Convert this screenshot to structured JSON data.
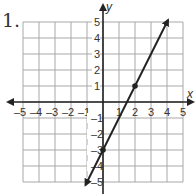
{
  "problem": {
    "number_label": "1."
  },
  "chart_data": {
    "type": "line",
    "title": "",
    "xlabel": "x",
    "ylabel": "y",
    "xlim": [
      -5,
      5
    ],
    "ylim": [
      -5,
      5
    ],
    "grid": true,
    "x_tick_labels": [
      "–5",
      "–4",
      "–3",
      "–2",
      "–1",
      "1",
      "2",
      "3",
      "4",
      "5"
    ],
    "y_tick_labels": [
      "5",
      "4",
      "3",
      "2",
      "1",
      "–1",
      "–2",
      "–3",
      "–4",
      "–5"
    ],
    "series": [
      {
        "name": "y = 2x − 3",
        "equation": "y = 2x - 3",
        "slope": 2,
        "y_intercept": -3,
        "line_start": [
          -1,
          -5
        ],
        "line_end": [
          4,
          5
        ],
        "arrows": "both",
        "marked_points": [
          [
            0,
            -3
          ],
          [
            2,
            1
          ]
        ]
      }
    ]
  },
  "colors": {
    "grid": "#a8a8a8",
    "axis": "#222222",
    "line": "#222222",
    "text": "#333333"
  }
}
